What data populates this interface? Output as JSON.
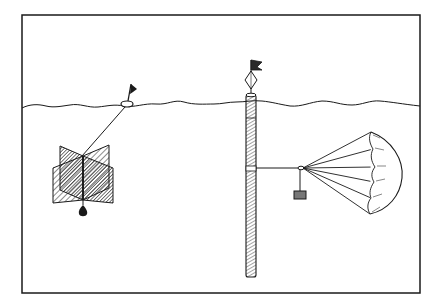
{
  "figure": {
    "colors": {
      "ink": "#1a1a1a",
      "paper": "#ffffff"
    }
  },
  "elements": {
    "frame": "border-frame",
    "water_surface": "wavy-waterline",
    "left_assembly": {
      "float": "surface-float",
      "flag": "float-flag",
      "tether": "float-tether",
      "drogue": "cross-vane-drogue",
      "weight": "teardrop-weight"
    },
    "right_assembly": {
      "spar": "spar-buoy",
      "reflector": "diamond-radar-reflector",
      "flag": "spar-flag",
      "bridle": "spar-to-parachute-line",
      "weight": "hanging-weight",
      "drogue": "parachute-drogue"
    }
  }
}
